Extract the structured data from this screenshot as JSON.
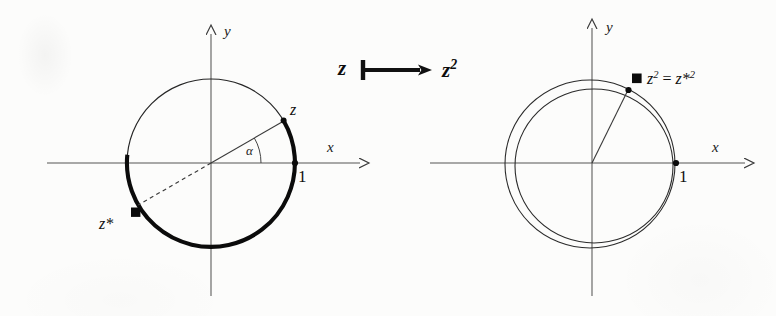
{
  "figure": {
    "background_color": "#fcfcfb",
    "ink_color": "#1a1a1a",
    "mapping": {
      "source_label": "z",
      "arrow_icon": "maps-to-arrow",
      "target_label": "z",
      "target_exponent": "2"
    },
    "left_panel": {
      "name": "unit-circle-z-plane",
      "x_axis_label": "x",
      "y_axis_label": "y",
      "origin": {
        "x": 211,
        "y": 163
      },
      "radius": 84,
      "unit_point_label": "1",
      "unit_point_angle_deg": 0,
      "z_label": "z",
      "z_angle_deg": 30,
      "z_conj_label": "z*",
      "z_conj_angle_deg": 210,
      "angle_label": "α",
      "highlight_arc": {
        "description": "bold arc from z clockwise through 1 and the lower half to just past 180°",
        "start_angle_deg": 30,
        "end_angle_deg": -185
      },
      "dashed_radius": {
        "description": "dashed line from origin to z*",
        "angle_deg": 210
      },
      "solid_radius": {
        "description": "solid line from origin to z",
        "angle_deg": 30
      }
    },
    "right_panel": {
      "name": "double-wrapped-circle-z-squared-plane",
      "x_axis_label": "x",
      "y_axis_label": "y",
      "origin": {
        "x": 592,
        "y": 163
      },
      "radius": 84,
      "unit_point_label": "1",
      "unit_point_angle_deg": 0,
      "result_label": "z",
      "result_exponent": "2",
      "result_equals": "=",
      "result_conj_label": "z*",
      "result_conj_exponent": "2",
      "image_point_angle_deg": 60,
      "spiral": {
        "description": "curve wrapping twice around the circle, drawn as an offset spiral",
        "turns": 2
      }
    }
  }
}
